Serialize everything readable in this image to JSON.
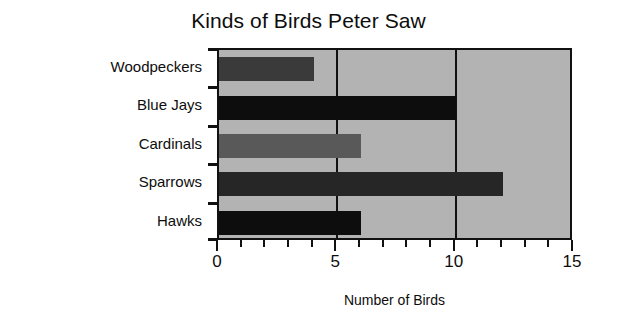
{
  "chart_data": {
    "type": "bar",
    "orientation": "horizontal",
    "title": "Kinds of Birds Peter Saw",
    "xlabel": "Number of Birds",
    "ylabel": "Kind of Bird",
    "categories": [
      "Woodpeckers",
      "Blue Jays",
      "Cardinals",
      "Sparrows",
      "Hawks"
    ],
    "values": [
      4,
      10,
      6,
      12,
      6
    ],
    "bar_colors": [
      "#3a3a3a",
      "#0d0d0d",
      "#595959",
      "#262626",
      "#0d0d0d"
    ],
    "xlim": [
      0,
      15
    ],
    "xticks": [
      0,
      5,
      10,
      15
    ],
    "xtick_labels": [
      "0",
      "5",
      "10",
      "15"
    ],
    "minor_tick_step": 1,
    "grid": true,
    "gridlines_at": [
      5,
      10
    ],
    "plot_background": "#b3b3b3",
    "axis_color": "#111111",
    "legend": null
  }
}
